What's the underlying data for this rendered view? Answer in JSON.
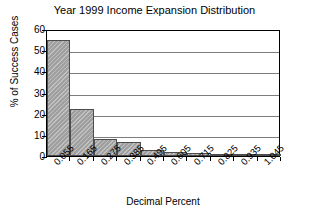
{
  "chart_data": {
    "type": "bar",
    "title": "Year 1999 Income Expansion Distribution",
    "xlabel": "Decimal Percent",
    "ylabel": "% of Success Cases",
    "categories": [
      "0.055",
      "0.165",
      "0.275",
      "0.385",
      "0.495",
      "0.605",
      "0.715",
      "0.825",
      "0.935",
      "1.045"
    ],
    "values": [
      55,
      22,
      8,
      6.5,
      3,
      1.8,
      1.5,
      0.4,
      0.5,
      0.2
    ],
    "ylim": [
      0,
      60
    ],
    "yticks": [
      "0",
      "10",
      "20",
      "30",
      "40",
      "50",
      "60"
    ],
    "ytick_values": [
      0,
      10,
      20,
      30,
      40,
      50,
      60
    ],
    "grid": "horizontal",
    "legend": "none",
    "bar_style": "contiguous-histogram",
    "bar_color": "#a8a8a8",
    "bar_edge_color": "#4d4d4d",
    "grid_color": "#7d7d7d",
    "axis_color": "#000000",
    "xtick_rotation": -45
  }
}
